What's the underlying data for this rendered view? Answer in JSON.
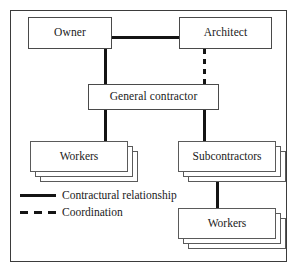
{
  "diagram": {
    "type": "organization-hierarchy",
    "background_color": "#ffffff",
    "line_color": "#141414",
    "box_border_color": "#4a4a4a",
    "frame_color": "#3b3b3b"
  },
  "nodes": {
    "owner": {
      "label": "Owner",
      "stacked": false
    },
    "architect": {
      "label": "Architect",
      "stacked": false
    },
    "general_contractor": {
      "label": "General contractor",
      "stacked": false
    },
    "workers_left": {
      "label": "Workers",
      "stacked": true,
      "layers": 3
    },
    "subcontractors": {
      "label": "Subcontractors",
      "stacked": true,
      "layers": 3
    },
    "workers_bottom": {
      "label": "Workers",
      "stacked": true,
      "layers": 3
    }
  },
  "connections": [
    {
      "from": "owner",
      "to": "architect",
      "style": "solid",
      "meaning": "Contractural relationship"
    },
    {
      "from": "owner",
      "to": "general_contractor",
      "style": "solid",
      "meaning": "Contractural relationship"
    },
    {
      "from": "architect",
      "to": "general_contractor",
      "style": "dashed",
      "meaning": "Coordination"
    },
    {
      "from": "general_contractor",
      "to": "workers_left",
      "style": "solid",
      "meaning": "Contractural relationship"
    },
    {
      "from": "general_contractor",
      "to": "subcontractors",
      "style": "solid",
      "meaning": "Contractural relationship"
    },
    {
      "from": "subcontractors",
      "to": "workers_bottom",
      "style": "solid",
      "meaning": "Contractural relationship"
    }
  ],
  "legend": {
    "items": [
      {
        "style": "solid",
        "label": "Contractural relationship"
      },
      {
        "style": "dashed",
        "label": "Coordination"
      }
    ]
  }
}
